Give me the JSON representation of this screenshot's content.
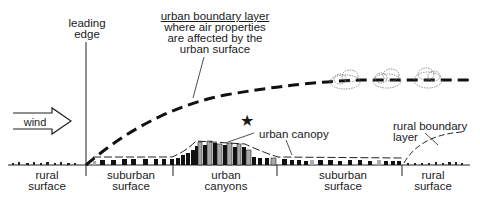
{
  "diagram": {
    "labels": {
      "leading_edge": [
        "leading",
        "edge"
      ],
      "ubl_title": "urban boundary layer",
      "ubl_desc": [
        "where air properties",
        "are affected by the",
        "urban surface"
      ],
      "wind": "wind",
      "urban_canopy": "urban canopy",
      "rural_bl": [
        "rural boundary",
        "layer"
      ]
    },
    "zones": [
      {
        "line1": "rural",
        "line2": "surface"
      },
      {
        "line1": "suburban",
        "line2": "surface"
      },
      {
        "line1": "urban",
        "line2": "canyons"
      },
      {
        "line1": "suburban",
        "line2": "surface"
      },
      {
        "line1": "rural",
        "line2": "surface"
      }
    ],
    "icons": {
      "star": "★",
      "clouds": 3,
      "wind_arrow": "hollow-right-arrow"
    },
    "colors": {
      "ink": "#111111",
      "building_dark": "#111111",
      "building_grey": "#a8a8a8"
    }
  }
}
